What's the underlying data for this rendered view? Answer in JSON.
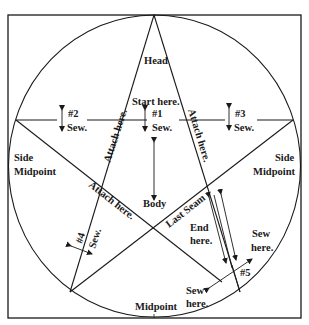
{
  "diagram": {
    "type": "five-pointed star pattern in circle",
    "colors": {
      "line": "#1a1a1a",
      "background": "#ffffff"
    },
    "labels": {
      "head": "Head",
      "start_here": "Start here.",
      "seam1_num": "#1",
      "seam1_sew": "Sew.",
      "seam2_num": "#2",
      "seam2_sew": "Sew.",
      "seam3_num": "#3",
      "seam3_sew": "Sew.",
      "attach_left": "Attach here.",
      "attach_right": "Attach here.",
      "attach_lower": "Attach here.",
      "side_left_1": "Side",
      "side_left_2": "Midpoint",
      "side_right_1": "Side",
      "side_right_2": "Midpoint",
      "body": "Body",
      "last_seam": "Last Seam",
      "seam4_num": "#4",
      "seam4_sew": "Sew.",
      "end_here_1": "End",
      "end_here_2": "here.",
      "sew_here_right_1": "Sew",
      "sew_here_right_2": "here.",
      "seam5_num": "#5",
      "sew_here_left_1": "Sew",
      "sew_here_left_2": "here.",
      "midpoint": "Midpoint"
    }
  }
}
